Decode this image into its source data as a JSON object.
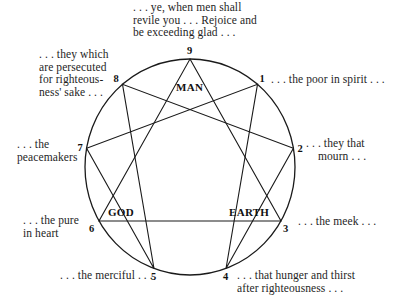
{
  "diagram": {
    "type": "enneagram",
    "circle": {
      "cx": 190,
      "cy": 167,
      "rx": 105,
      "ry": 108,
      "stroke": "#1a1a1a"
    },
    "points": [
      {
        "n": "9",
        "x": 190,
        "y": 59
      },
      {
        "n": "1",
        "x": 257.5,
        "y": 84.3
      },
      {
        "n": "2",
        "x": 293.4,
        "y": 148.2
      },
      {
        "n": "3",
        "x": 281,
        "y": 221
      },
      {
        "n": "4",
        "x": 226,
        "y": 268.5
      },
      {
        "n": "5",
        "x": 154,
        "y": 268.5
      },
      {
        "n": "6",
        "x": 99,
        "y": 221
      },
      {
        "n": "7",
        "x": 86.6,
        "y": 148.2
      },
      {
        "n": "8",
        "x": 122.5,
        "y": 84.3
      }
    ],
    "triangle": [
      "9",
      "3",
      "6"
    ],
    "hexad": [
      "1",
      "4",
      "2",
      "8",
      "5",
      "7"
    ],
    "inner_labels": {
      "man": "MAN",
      "god": "GOD",
      "earth": "EARTH"
    }
  },
  "captions": {
    "p9": ". . . ye, when men shall\nrevile you . . . Rejoice and\nbe exceeding glad . . .",
    "p1": ". . . the poor in spirit . . .",
    "p2": ". . . they that\n    mourn . . .",
    "p3": ". . . the meek . . .",
    "p4": ". . . that hunger and thirst\nafter righteousness . . .",
    "p5": ". . . the merciful . . .",
    "p6": ". . . the pure\nin heart",
    "p7": ". . . the\npeacemakers",
    "p8": ". . . they which\nare persecuted\nfor righteous-\nness' sake . . ."
  }
}
